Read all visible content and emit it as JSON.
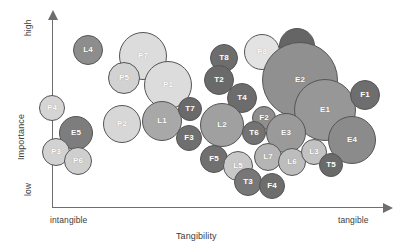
{
  "chart_data": {
    "type": "scatter",
    "subtype": "bubble",
    "title": "",
    "xlabel": "Tangibility",
    "ylabel": "Importance",
    "x_tick_labels": [
      "intangible",
      "tangible"
    ],
    "y_tick_labels": [
      "low",
      "high"
    ],
    "xlim": [
      "intangible",
      "tangible"
    ],
    "ylim": [
      "low",
      "high"
    ],
    "grid": false,
    "legend": "none",
    "axis_style": "arrow",
    "note": "Bubble positions are read off the plot in pixel space; x increases toward 'tangible', y increases toward 'high'. Size encodes a third magnitude.",
    "points": [
      {
        "label": "L4",
        "x": 88,
        "y": 50,
        "r": 15,
        "color": "#8d8d8d",
        "text": "light"
      },
      {
        "label": "P7",
        "x": 143,
        "y": 56,
        "r": 24,
        "color": "#dcdcdc",
        "text": "light"
      },
      {
        "label": "P5",
        "x": 124,
        "y": 78,
        "r": 16,
        "color": "#d2d2d2",
        "text": "light"
      },
      {
        "label": "P1",
        "x": 168,
        "y": 85,
        "r": 24,
        "color": "#dcdcdc",
        "text": "light"
      },
      {
        "label": "P4",
        "x": 52,
        "y": 108,
        "r": 13,
        "color": "#d5d5d5",
        "text": "light"
      },
      {
        "label": "E5",
        "x": 76,
        "y": 133,
        "r": 17,
        "color": "#7d7d7d",
        "text": "light"
      },
      {
        "label": "P3",
        "x": 56,
        "y": 152,
        "r": 14,
        "color": "#d2d2d2",
        "text": "light"
      },
      {
        "label": "P6",
        "x": 78,
        "y": 161,
        "r": 14,
        "color": "#cfcfcf",
        "text": "light"
      },
      {
        "label": "P2",
        "x": 122,
        "y": 124,
        "r": 19,
        "color": "#d7d7d7",
        "text": "light"
      },
      {
        "label": "L1",
        "x": 162,
        "y": 121,
        "r": 20,
        "color": "#a8a8a8",
        "text": "light"
      },
      {
        "label": "T7",
        "x": 190,
        "y": 109,
        "r": 12,
        "color": "#6a6a6a",
        "text": "dark"
      },
      {
        "label": "F3",
        "x": 189,
        "y": 138,
        "r": 13,
        "color": "#6f6f6f",
        "text": "dark"
      },
      {
        "label": "T8",
        "x": 224,
        "y": 58,
        "r": 14,
        "color": "#6d6d6d",
        "text": "dark"
      },
      {
        "label": "T2",
        "x": 219,
        "y": 80,
        "r": 15,
        "color": "#6a6a6a",
        "text": "dark"
      },
      {
        "label": "T4",
        "x": 242,
        "y": 98,
        "r": 15,
        "color": "#6c6c6c",
        "text": "dark"
      },
      {
        "label": "P8",
        "x": 262,
        "y": 52,
        "r": 18,
        "color": "#e3e3e3",
        "text": "light"
      },
      {
        "label": "T1",
        "x": 297,
        "y": 46,
        "r": 18,
        "color": "#656565",
        "text": "dark"
      },
      {
        "label": "E2",
        "x": 300,
        "y": 80,
        "r": 38,
        "color": "#909090",
        "text": "light"
      },
      {
        "label": "E1",
        "x": 325,
        "y": 110,
        "r": 31,
        "color": "#979797",
        "text": "light"
      },
      {
        "label": "F1",
        "x": 365,
        "y": 95,
        "r": 15,
        "color": "#6e6e6e",
        "text": "dark"
      },
      {
        "label": "F2",
        "x": 264,
        "y": 118,
        "r": 12,
        "color": "#8f8f8f",
        "text": "light"
      },
      {
        "label": "L2",
        "x": 222,
        "y": 125,
        "r": 22,
        "color": "#a0a0a0",
        "text": "light"
      },
      {
        "label": "T6",
        "x": 254,
        "y": 133,
        "r": 12,
        "color": "#737373",
        "text": "dark"
      },
      {
        "label": "E3",
        "x": 286,
        "y": 133,
        "r": 20,
        "color": "#9a9a9a",
        "text": "light"
      },
      {
        "label": "E4",
        "x": 352,
        "y": 140,
        "r": 24,
        "color": "#8b8b8b",
        "text": "light"
      },
      {
        "label": "F5",
        "x": 214,
        "y": 159,
        "r": 14,
        "color": "#707070",
        "text": "dark"
      },
      {
        "label": "L5",
        "x": 238,
        "y": 166,
        "r": 15,
        "color": "#c8c8c8",
        "text": "light"
      },
      {
        "label": "L7",
        "x": 268,
        "y": 157,
        "r": 14,
        "color": "#b5b5b5",
        "text": "light"
      },
      {
        "label": "L6",
        "x": 292,
        "y": 162,
        "r": 14,
        "color": "#bdbdbd",
        "text": "light"
      },
      {
        "label": "L3",
        "x": 314,
        "y": 152,
        "r": 13,
        "color": "#c2c2c2",
        "text": "light"
      },
      {
        "label": "T5",
        "x": 331,
        "y": 165,
        "r": 12,
        "color": "#6a6a6a",
        "text": "dark"
      },
      {
        "label": "T3",
        "x": 248,
        "y": 182,
        "r": 14,
        "color": "#777777",
        "text": "dark"
      },
      {
        "label": "F4",
        "x": 272,
        "y": 186,
        "r": 13,
        "color": "#6d6d6d",
        "text": "dark"
      }
    ]
  },
  "axes": {
    "y_high": "high",
    "y_low": "low",
    "y_title": "Importance",
    "x_left": "intangible",
    "x_right": "tangible",
    "x_title": "Tangibility"
  }
}
